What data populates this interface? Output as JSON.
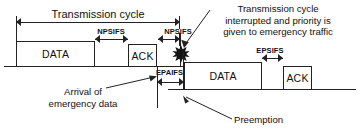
{
  "diagram": {
    "title_hidden": "Preemption of a transmission cycle by emergency traffic",
    "timelines": [
      {
        "name": "normal-priority-timeline",
        "frames": [
          {
            "label": "DATA",
            "name": "data-frame-1"
          },
          {
            "label": "ACK",
            "name": "ack-frame-1"
          }
        ]
      },
      {
        "name": "emergency-priority-timeline",
        "frames": [
          {
            "label": "DATA",
            "name": "data-frame-2"
          },
          {
            "label": "ACK",
            "name": "ack-frame-2"
          }
        ]
      }
    ],
    "intervals": [
      {
        "key": "transmission_cycle",
        "label": "Transmission cycle"
      },
      {
        "key": "npsifs_1",
        "label": "NPSIFS"
      },
      {
        "key": "npsifs_2",
        "label": "NPSIFS"
      },
      {
        "key": "epaifs",
        "label": "EPAIFS"
      },
      {
        "key": "epsifs",
        "label": "EPSIFS"
      }
    ],
    "annotations": [
      {
        "key": "interrupt_note",
        "lines": [
          "Transmission cycle",
          "interrupted and priority is",
          "given to emergency traffic"
        ]
      },
      {
        "key": "arrival_note",
        "lines": [
          "Arrival of",
          "emergency data"
        ]
      },
      {
        "key": "preemption_note",
        "lines": [
          "Preemption"
        ]
      }
    ],
    "markers": [
      {
        "key": "interrupt_burst",
        "name": "interruption-burst-icon"
      }
    ],
    "colors": {
      "stroke": "#222222",
      "text": "#111111",
      "background": "#ffffff"
    }
  }
}
